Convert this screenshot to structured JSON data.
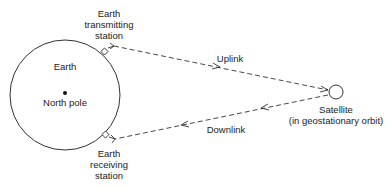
{
  "diagram": {
    "earth": {
      "label": "Earth",
      "pole_label": "North pole"
    },
    "transmitting_station": {
      "lines": [
        "Earth",
        "transmitting",
        "station"
      ]
    },
    "receiving_station": {
      "lines": [
        "Earth",
        "receiving",
        "station"
      ]
    },
    "uplink": {
      "label": "Uplink"
    },
    "downlink": {
      "label": "Downlink"
    },
    "satellite": {
      "label": "Satellite",
      "sublabel": "(in geostationary orbit)"
    },
    "colors": {
      "stroke": "#333333",
      "text": "#222222",
      "background": "#ffffff"
    }
  }
}
